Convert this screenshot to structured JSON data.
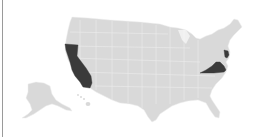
{
  "map": {
    "type": "choropleth",
    "region": "United States",
    "colors": {
      "background": "#ffffff",
      "base_fill": "#d9d9d9",
      "border": "#efefef",
      "highlight_fill": "#3a3a3a",
      "frame_line": "#9a9a9a"
    },
    "highlighted_states": [
      "California",
      "Virginia",
      "New Jersey"
    ],
    "other_regions": [
      "Alaska",
      "Hawaii"
    ]
  }
}
